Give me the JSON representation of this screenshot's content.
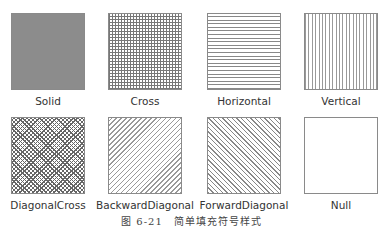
{
  "figure": {
    "caption": "图 6-21　简单填充符号样式",
    "fill_styles": [
      {
        "label": "Solid",
        "pattern": "solid",
        "color": "#8c8c8c"
      },
      {
        "label": "Cross",
        "pattern": "cross"
      },
      {
        "label": "Horizontal",
        "pattern": "horizontal"
      },
      {
        "label": "Vertical",
        "pattern": "vertical"
      },
      {
        "label": "DiagonalCross",
        "pattern": "diagonal-cross"
      },
      {
        "label": "BackwardDiagonal",
        "pattern": "backward-diagonal"
      },
      {
        "label": "ForwardDiagonal",
        "pattern": "forward-diagonal"
      },
      {
        "label": "Null",
        "pattern": "none"
      }
    ]
  }
}
